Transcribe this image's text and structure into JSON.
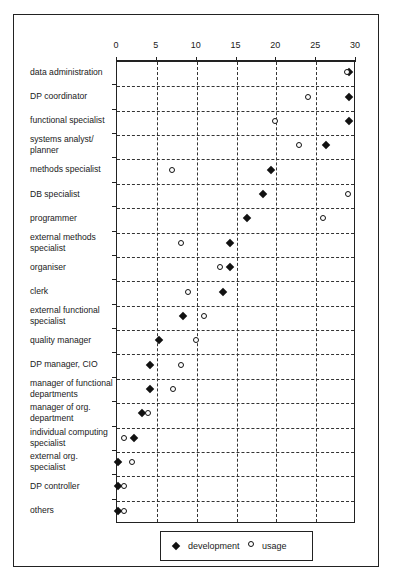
{
  "chart_data": {
    "type": "scatter",
    "orientation": "horizontal-dot-plot",
    "title": "",
    "xlabel": "",
    "ylabel": "",
    "xlim": [
      0,
      30
    ],
    "x_ticks": [
      0,
      5,
      10,
      15,
      20,
      25,
      30
    ],
    "grid": true,
    "legend_position": "bottom",
    "categories": [
      "data administration",
      "DP coordinator",
      "functional specialist",
      "systems analyst/ planner",
      "methods specialist",
      "DB specialist",
      "programmer",
      "external methods specialist",
      "organiser",
      "clerk",
      "external functional specialist",
      "quality manager",
      "DP manager, CIO",
      "manager of functional departments",
      "manager of org. department",
      "individual computing specialist",
      "external org. specialist",
      "DP controller",
      "others"
    ],
    "series": [
      {
        "name": "development",
        "marker": "diamond-filled",
        "values": [
          29.3,
          29.3,
          29.3,
          26.3,
          19.4,
          18.4,
          16.4,
          14.3,
          14.3,
          13.4,
          8.4,
          5.4,
          4.3,
          4.3,
          3.3,
          2.3,
          0.3,
          0.3,
          0.3
        ]
      },
      {
        "name": "usage",
        "marker": "circle-open",
        "values": [
          29.0,
          24.1,
          20.0,
          23.0,
          7.0,
          29.1,
          26.0,
          8.1,
          13.1,
          9.1,
          11.1,
          10.1,
          8.1,
          7.1,
          4.0,
          1.0,
          2.0,
          1.0,
          1.0
        ]
      }
    ]
  },
  "axis": {
    "tick_labels": [
      "0",
      "5",
      "10",
      "15",
      "20",
      "25",
      "30"
    ]
  },
  "rows": [
    {
      "line1": "data administration",
      "line2": ""
    },
    {
      "line1": "DP coordinator",
      "line2": ""
    },
    {
      "line1": "functional specialist",
      "line2": ""
    },
    {
      "line1": "systems analyst/",
      "line2": "planner"
    },
    {
      "line1": "methods specialist",
      "line2": ""
    },
    {
      "line1": "DB specialist",
      "line2": ""
    },
    {
      "line1": "programmer",
      "line2": ""
    },
    {
      "line1": "external methods",
      "line2": "specialist"
    },
    {
      "line1": "organiser",
      "line2": ""
    },
    {
      "line1": "clerk",
      "line2": ""
    },
    {
      "line1": "external functional",
      "line2": "specialist"
    },
    {
      "line1": "quality manager",
      "line2": ""
    },
    {
      "line1": "DP manager, CIO",
      "line2": ""
    },
    {
      "line1": "manager of functional",
      "line2": "departments"
    },
    {
      "line1": "manager of org.",
      "line2": "department"
    },
    {
      "line1": "individual computing",
      "line2": "specialist"
    },
    {
      "line1": "external org.",
      "line2": "specialist"
    },
    {
      "line1": "DP controller",
      "line2": ""
    },
    {
      "line1": "others",
      "line2": ""
    }
  ],
  "legend": {
    "development": "development",
    "usage": "usage"
  }
}
